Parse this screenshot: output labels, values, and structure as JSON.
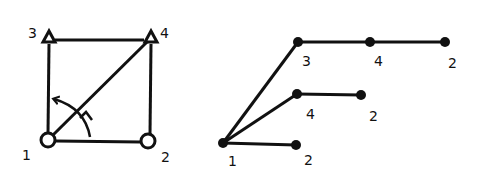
{
  "left_diagram": {
    "nodes": [
      {
        "id": "1",
        "label": "1",
        "shape": "circle"
      },
      {
        "id": "2",
        "label": "2",
        "shape": "circle"
      },
      {
        "id": "3",
        "label": "3",
        "shape": "triangle"
      },
      {
        "id": "4",
        "label": "4",
        "shape": "triangle"
      }
    ],
    "edges": [
      [
        "1",
        "2"
      ],
      [
        "1",
        "3"
      ],
      [
        "3",
        "4"
      ],
      [
        "2",
        "4"
      ],
      [
        "1",
        "4"
      ]
    ],
    "annotation": "curved arrow from edge 1-4 rotating toward edge 1-3"
  },
  "right_diagram": {
    "root": "1",
    "branches": [
      {
        "path": [
          "1",
          "3",
          "4",
          "2"
        ]
      },
      {
        "path": [
          "1",
          "4",
          "2"
        ]
      },
      {
        "path": [
          "1",
          "2"
        ]
      }
    ],
    "labels": {
      "root": "1",
      "b1_n1": "3",
      "b1_n2": "4",
      "b1_n3": "2",
      "b2_n1": "4",
      "b2_n2": "2",
      "b3_n1": "2"
    }
  },
  "colors": {
    "stroke": "#111111",
    "background": "#ffffff"
  }
}
